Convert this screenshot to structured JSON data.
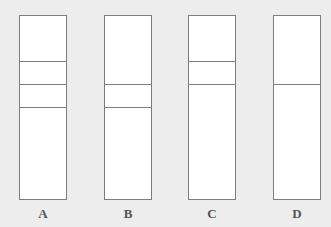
{
  "figure": {
    "background": "#ededed",
    "line_color": "#7d7d7d",
    "tubes": [
      {
        "label": "A",
        "left": 19,
        "bands": [
          46,
          69,
          92
        ]
      },
      {
        "label": "B",
        "left": 104,
        "bands": [
          69,
          92
        ]
      },
      {
        "label": "C",
        "left": 188,
        "bands": [
          46,
          69
        ]
      },
      {
        "label": "D",
        "left": 273,
        "bands": [
          69
        ]
      }
    ]
  }
}
